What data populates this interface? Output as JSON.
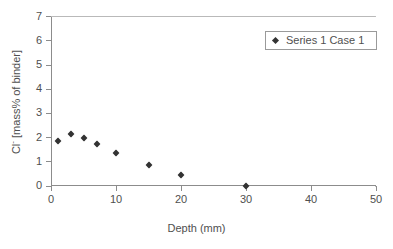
{
  "chart_data": {
    "type": "scatter",
    "title": "",
    "subtitle": "",
    "xlabel": "Depth (mm)",
    "ylabel": "Cl⁻ [mass% of binder]",
    "ylabel_base": "Cl",
    "ylabel_sup": "-",
    "ylabel_rest": " [mass% of binder]",
    "xlim": [
      0,
      50
    ],
    "ylim": [
      0,
      7
    ],
    "xticks": [
      0,
      10,
      20,
      30,
      40,
      50
    ],
    "yticks": [
      0,
      1,
      2,
      3,
      4,
      5,
      6,
      7
    ],
    "xticklabels": [
      "0",
      "10",
      "20",
      "30",
      "40",
      "50"
    ],
    "yticklabels": [
      "0",
      "1",
      "2",
      "3",
      "4",
      "5",
      "6",
      "7"
    ],
    "grid": false,
    "legend_position": "top-right",
    "marker_color": "#333333",
    "axis_color": "#8c8c8c",
    "background": "#ffffff",
    "series": [
      {
        "name": "Series 1 Case 1",
        "marker": "diamond",
        "points": [
          {
            "x": 1,
            "y": 1.85
          },
          {
            "x": 3,
            "y": 2.15
          },
          {
            "x": 5,
            "y": 2.0
          },
          {
            "x": 7,
            "y": 1.75
          },
          {
            "x": 10,
            "y": 1.35
          },
          {
            "x": 15,
            "y": 0.85
          },
          {
            "x": 20,
            "y": 0.45
          },
          {
            "x": 30,
            "y": 0.0
          }
        ]
      }
    ]
  },
  "legend": {
    "entries": [
      {
        "label": "Series 1 Case 1"
      }
    ]
  }
}
